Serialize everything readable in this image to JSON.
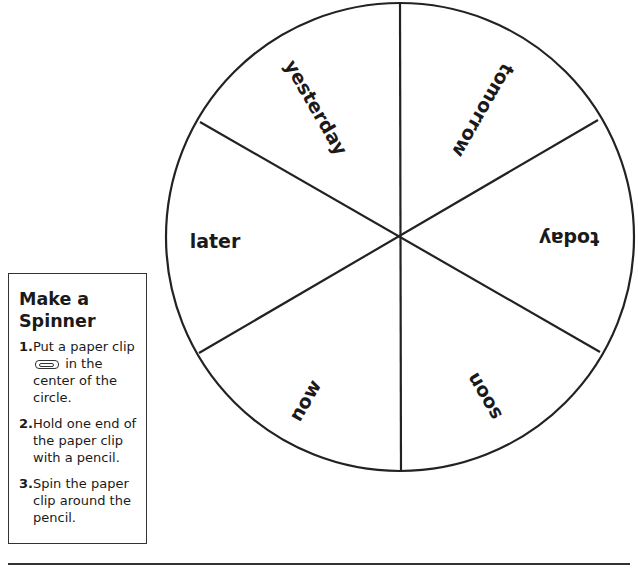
{
  "spinner": {
    "sections": [
      {
        "label": "yesterday"
      },
      {
        "label": "tomorrow"
      },
      {
        "label": "today"
      },
      {
        "label": "soon"
      },
      {
        "label": "now"
      },
      {
        "label": "later"
      }
    ]
  },
  "instructions": {
    "title_line1": "Make a",
    "title_line2": "Spinner",
    "steps": [
      {
        "number": "1.",
        "text_before_icon": "Put a paper clip",
        "icon": "paper-clip-icon",
        "text_after_icon": "in the center of the circle."
      },
      {
        "number": "2.",
        "text": "Hold one end of the paper clip with a pencil."
      },
      {
        "number": "3.",
        "text": "Spin the paper clip around the pencil."
      }
    ]
  }
}
